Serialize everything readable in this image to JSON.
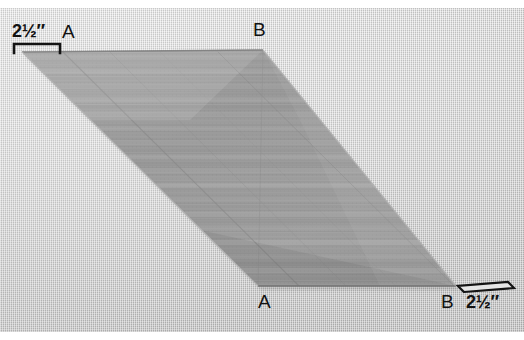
{
  "image": {
    "kind": "photograph",
    "subject": "strip-pieced fabric parallelogram on light gray textured background",
    "width": 524,
    "height": 340,
    "background_color": "#cfcfcf",
    "fabric_color": "#9c9c9c",
    "ink_color": "#121212"
  },
  "labels": {
    "vertex_a_top": "A",
    "vertex_b_top": "B",
    "vertex_a_bottom": "A",
    "vertex_b_bottom": "B"
  },
  "measurements": {
    "top_left": {
      "whole": "2",
      "fraction": "½",
      "unit": "″",
      "full": "2½″"
    },
    "bottom_right": {
      "whole": "2",
      "fraction": "½",
      "unit": "″",
      "full": "2½″"
    }
  },
  "shape": {
    "type": "parallelogram",
    "vertices": {
      "top_left": [
        22,
        52
      ],
      "top_right": [
        263,
        50
      ],
      "bottom_right": [
        456,
        286
      ],
      "bottom_left": [
        258,
        286
      ]
    },
    "stripe_count": 34,
    "stripe_orientation": "horizontal"
  }
}
